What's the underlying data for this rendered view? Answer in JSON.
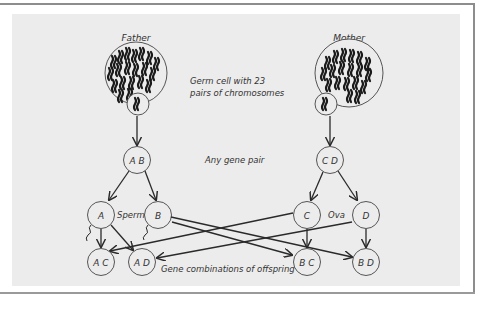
{
  "diagram": {
    "parents": {
      "father": "Father",
      "mother": "Mother"
    },
    "annotations": {
      "germ_cell_line1": "Germ cell with 23",
      "germ_cell_line2": "pairs of chromosomes",
      "gene_pair": "Any gene pair",
      "sperm": "Sperm",
      "ova": "Ova",
      "offspring": "Gene combinations of offspring"
    },
    "nodes": {
      "father_pair": "A B",
      "mother_pair": "C D",
      "sperm_a": "A",
      "sperm_b": "B",
      "ovum_c": "C",
      "ovum_d": "D",
      "offspring_ac": "A C",
      "offspring_ad": "A D",
      "offspring_bc": "B C",
      "offspring_bd": "B D"
    },
    "colors": {
      "panel": "#ececec",
      "line": "#2a2a2a",
      "frame": "#8d8d8d"
    }
  }
}
